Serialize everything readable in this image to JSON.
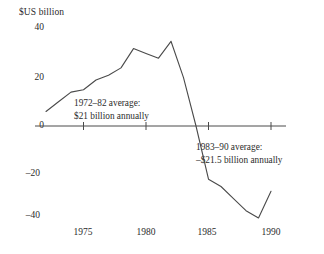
{
  "chart_data": {
    "type": "line",
    "title": "",
    "xlabel": "",
    "ylabel": "$US billion",
    "y_unit_label": "$US billion",
    "xlim": [
      1972,
      1990
    ],
    "ylim": [
      -44,
      40
    ],
    "grid": false,
    "legend": "none",
    "y_ticks": [
      {
        "value": 40,
        "label": "40"
      },
      {
        "value": 20,
        "label": "20"
      },
      {
        "value": 0,
        "label": "0"
      },
      {
        "value": -20,
        "label": "–20"
      },
      {
        "value": -40,
        "label": "–40"
      }
    ],
    "x_ticks": [
      {
        "value": 1975,
        "label": "1975"
      },
      {
        "value": 1980,
        "label": "1980"
      },
      {
        "value": 1985,
        "label": "1985"
      },
      {
        "value": 1990,
        "label": "1990"
      }
    ],
    "series": [
      {
        "name": "US current account balance",
        "x": [
          1972,
          1973,
          1974,
          1975,
          1976,
          1977,
          1978,
          1979,
          1980,
          1981,
          1982,
          1983,
          1984,
          1985,
          1986,
          1987,
          1988,
          1989,
          1990
        ],
        "values": [
          6,
          10,
          14,
          15,
          19,
          21,
          24,
          32,
          30,
          28,
          35,
          20,
          0,
          -22,
          -25,
          -30,
          -35,
          -38,
          -27
        ]
      }
    ],
    "annotations": [
      {
        "name": "upper-average-note",
        "line1": "1972–82 average:",
        "line2": "$21 billion annually",
        "period": "1972–82",
        "average_value": 21
      },
      {
        "name": "lower-average-note",
        "line1": "1983–90 average:",
        "line2": "–$21.5 billion annually",
        "period": "1983–90",
        "average_value": -21.5
      }
    ],
    "colors": {
      "line": "#4a4a4a",
      "axis": "#4a4a4a",
      "text": "#2b2b2b",
      "background": "#ffffff"
    }
  }
}
